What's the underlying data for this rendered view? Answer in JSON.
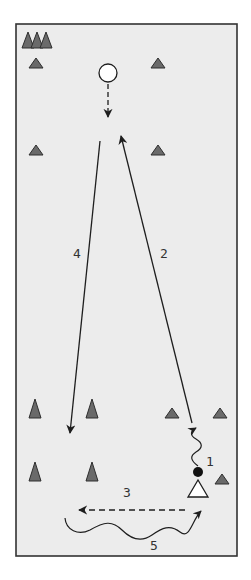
{
  "diagram": {
    "type": "soccer-drill",
    "colors": {
      "field_fill": "#ececec",
      "field_border": "#333333",
      "cone_fill": "#6a6a6a",
      "cone_stroke": "#2e2e2e",
      "line": "#1e1e1e",
      "player_fill": "#ffffff",
      "ball_fill": "#111111"
    },
    "labels": {
      "step_1": "1",
      "step_2": "2",
      "step_3": "3",
      "step_4": "4",
      "step_5": "5"
    },
    "legend_icons": {
      "cone": "cone-icon",
      "player": "player-triangle-icon",
      "ball": "ball-icon",
      "mannequin": "target-circle-icon"
    },
    "steps": [
      {
        "number": "1",
        "action": "dribble",
        "style": "wavy"
      },
      {
        "number": "2",
        "action": "run",
        "style": "solid"
      },
      {
        "number": "3",
        "action": "pass",
        "style": "dashed"
      },
      {
        "number": "4",
        "action": "run",
        "style": "solid"
      },
      {
        "number": "5",
        "action": "dribble",
        "style": "wavy"
      }
    ]
  }
}
